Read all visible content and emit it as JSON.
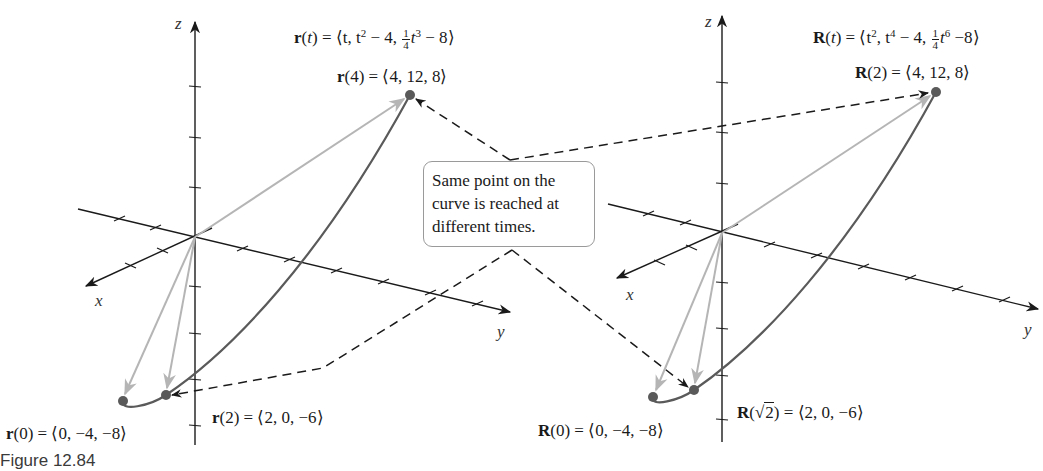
{
  "figure": {
    "caption": "Figure 12.84",
    "callout": "Same point on the curve is reached at different times.",
    "colors": {
      "axis": "#1a1a1a",
      "curve": "#5a5a5a",
      "position_vector": "#b5b5b5",
      "point": "#5a5a5a",
      "leader": "#1a1a1a",
      "callout_border": "#9a9a9a"
    },
    "left_plot": {
      "axis_labels": {
        "x": "x",
        "y": "y",
        "z": "z"
      },
      "function": {
        "name": "r",
        "arg": "t",
        "lhs": "r(t)",
        "rhs_prefix": "= ⟨t, t",
        "exp1": "2",
        "mid": " − 4, ",
        "frac_num": "1",
        "frac_den": "4",
        "t3": "t",
        "exp2": "3",
        "tail": " − 8⟩"
      },
      "points": [
        {
          "label_bold": "r",
          "label_rest": "(4) = ⟨4, 12, 8⟩",
          "t": "4",
          "coords": [
            4,
            12,
            8
          ]
        },
        {
          "label_bold": "r",
          "label_rest": "(2) = ⟨2, 0, −6⟩",
          "t": "2",
          "coords": [
            2,
            0,
            -6
          ]
        },
        {
          "label_bold": "r",
          "label_rest": "(0) = ⟨0, −4, −8⟩",
          "t": "0",
          "coords": [
            0,
            -4,
            -8
          ]
        }
      ]
    },
    "right_plot": {
      "axis_labels": {
        "x": "x",
        "y": "y",
        "z": "z"
      },
      "function": {
        "name": "R",
        "lhs": "R(t)",
        "rhs_prefix": "= ⟨t",
        "exp0": "2",
        "mid0": ", t",
        "exp1": "4",
        "mid": " − 4, ",
        "frac_num": "1",
        "frac_den": "4",
        "t6": "t",
        "exp2": "6",
        "tail": " −8⟩"
      },
      "points": [
        {
          "label_bold": "R",
          "label_rest": "(2) = ⟨4, 12, 8⟩",
          "t": "2",
          "coords": [
            4,
            12,
            8
          ]
        },
        {
          "label_bold": "R",
          "label_open": "(",
          "label_sqrt": "2",
          "label_rest": ") = ⟨2, 0, −6⟩",
          "t": "√2",
          "coords": [
            2,
            0,
            -6
          ]
        },
        {
          "label_bold": "R",
          "label_rest": "(0) = ⟨0, −4, −8⟩",
          "t": "0",
          "coords": [
            0,
            -4,
            -8
          ]
        }
      ]
    }
  }
}
